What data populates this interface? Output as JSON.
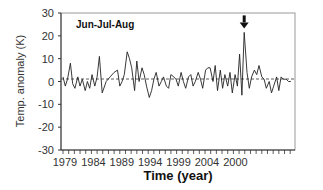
{
  "chart_data": {
    "type": "line",
    "title": "Jun-Jul-Aug",
    "xlabel": "Time (year)",
    "ylabel": "Temp. anomaly (K)",
    "ylim": [
      -30,
      30
    ],
    "yticks": [
      30,
      20,
      10,
      0,
      -10,
      -20,
      -30
    ],
    "xtick_labels": [
      "1979",
      "1984",
      "1989",
      "1994",
      "1999",
      "2004",
      "2000"
    ],
    "grid": false,
    "reference_line": {
      "y": 0,
      "style": "dashed"
    },
    "annotation": {
      "type": "arrow",
      "target": "peak",
      "x_index": 31.9,
      "value": 21.5
    },
    "series": [
      {
        "name": "Jun-Jul-Aug",
        "x": [
          0.0,
          0.4,
          0.8,
          1.3,
          1.7,
          2.1,
          2.6,
          3.0,
          3.4,
          3.9,
          4.3,
          4.7,
          5.1,
          5.6,
          6.0,
          6.4,
          6.9,
          7.6,
          8.3,
          9.0,
          9.6,
          10.0,
          10.4,
          10.8,
          11.3,
          11.7,
          12.1,
          12.6,
          13.0,
          13.4,
          13.9,
          14.3,
          14.7,
          15.2,
          15.6,
          16.0,
          16.4,
          16.9,
          17.3,
          17.7,
          18.2,
          18.6,
          19.0,
          19.5,
          19.9,
          20.3,
          20.8,
          21.2,
          21.6,
          22.1,
          22.5,
          22.9,
          23.3,
          23.8,
          24.2,
          24.6,
          25.1,
          25.5,
          25.9,
          26.4,
          26.8,
          27.2,
          27.7,
          28.1,
          28.5,
          29.0,
          29.4,
          29.8,
          30.3,
          30.7,
          31.1,
          31.5,
          31.9,
          32.4,
          32.8,
          33.2,
          33.7,
          34.1,
          34.5,
          35.0,
          35.4,
          35.8,
          36.3,
          36.7,
          37.1,
          37.6,
          38.0,
          38.4,
          38.8,
          39.3,
          39.7,
          40.1
        ],
        "values": [
          2,
          -2,
          1,
          8,
          -1,
          -3,
          2,
          -2,
          1,
          -4,
          0,
          -3,
          3,
          -2,
          2,
          11,
          -5,
          0,
          2,
          4,
          5,
          -2,
          0,
          3,
          13,
          10,
          6,
          -4,
          9,
          0,
          6,
          3,
          -2,
          -7,
          -4,
          1,
          4,
          -2,
          0,
          2,
          -2,
          -3,
          3,
          2,
          1,
          -2,
          4,
          0,
          -3,
          2,
          3,
          -2,
          0,
          4,
          1,
          -3,
          5,
          6,
          6,
          0,
          7,
          -4,
          5,
          -3,
          3,
          -2,
          4,
          -5,
          3,
          -2,
          12,
          -6,
          21.5,
          4,
          -3,
          2,
          5,
          3,
          7,
          2,
          1,
          -3,
          0,
          -5,
          -2,
          2,
          -4,
          2,
          1,
          1,
          0,
          0
        ]
      }
    ]
  }
}
